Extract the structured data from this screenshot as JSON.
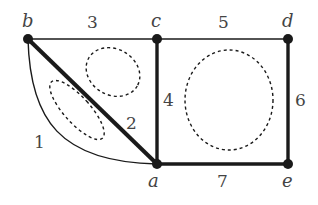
{
  "diagram": {
    "type": "graph",
    "vertices": [
      {
        "id": "b",
        "label": "b",
        "x": 28,
        "y": 39
      },
      {
        "id": "c",
        "label": "c",
        "x": 157,
        "y": 39
      },
      {
        "id": "d",
        "label": "d",
        "x": 288,
        "y": 39
      },
      {
        "id": "a",
        "label": "a",
        "x": 157,
        "y": 164
      },
      {
        "id": "e",
        "label": "e",
        "x": 288,
        "y": 164
      }
    ],
    "edges": [
      {
        "id": "e1",
        "label": "1",
        "from": "b",
        "to": "a",
        "style": "thin-curve"
      },
      {
        "id": "e2",
        "label": "2",
        "from": "b",
        "to": "a",
        "style": "thick"
      },
      {
        "id": "e3",
        "label": "3",
        "from": "b",
        "to": "c",
        "style": "thin"
      },
      {
        "id": "e4",
        "label": "4",
        "from": "c",
        "to": "a",
        "style": "thick"
      },
      {
        "id": "e5",
        "label": "5",
        "from": "c",
        "to": "d",
        "style": "thin"
      },
      {
        "id": "e6",
        "label": "6",
        "from": "d",
        "to": "e",
        "style": "thick"
      },
      {
        "id": "e7",
        "label": "7",
        "from": "a",
        "to": "e",
        "style": "thick"
      }
    ],
    "faces": [
      {
        "id": "face-b-a-curve",
        "shape": "dashed-ellipse"
      },
      {
        "id": "face-b-c-a",
        "shape": "dashed-ellipse"
      },
      {
        "id": "face-c-d-e-a",
        "shape": "dashed-circle"
      }
    ],
    "colors": {
      "stroke": "#1a1a1a",
      "label": "#444444"
    }
  }
}
